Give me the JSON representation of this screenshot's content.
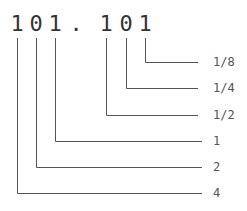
{
  "diagram": {
    "digits": [
      {
        "char": "1",
        "x": 17
      },
      {
        "char": "0",
        "x": 36
      },
      {
        "char": "1",
        "x": 55
      },
      {
        "char": ".",
        "x": 76
      },
      {
        "char": "1",
        "x": 106
      },
      {
        "char": "0",
        "x": 126
      },
      {
        "char": "1",
        "x": 145
      }
    ],
    "place_values": [
      {
        "label": "1/8",
        "digit_index": 6,
        "x": 145,
        "y": 62
      },
      {
        "label": "1/4",
        "digit_index": 5,
        "x": 126,
        "y": 88
      },
      {
        "label": "1/2",
        "digit_index": 4,
        "x": 106,
        "y": 115
      },
      {
        "label": "1",
        "digit_index": 2,
        "x": 55,
        "y": 141
      },
      {
        "label": "2",
        "digit_index": 1,
        "x": 36,
        "y": 167
      },
      {
        "label": "4",
        "digit_index": 0,
        "x": 17,
        "y": 193
      }
    ],
    "line_color": "#555555",
    "text_color": "#333333"
  }
}
